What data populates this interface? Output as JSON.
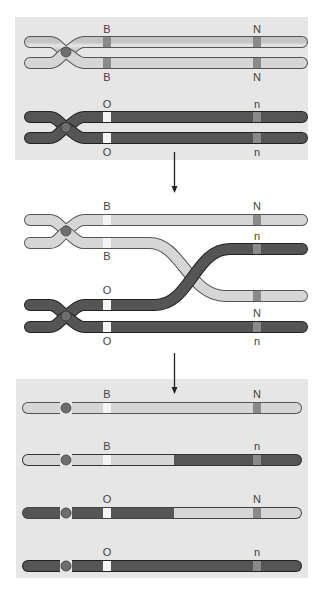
{
  "diagram": {
    "colors": {
      "panel_bg": "#e6e6e6",
      "light_chromatid": "#d2d2d2",
      "dark_chromatid": "#4a4a4a",
      "centromere": "#6e6e6e",
      "band_dark": "#8a8a8a",
      "band_white": "#f4f4f4",
      "arrow": "#222222"
    },
    "stages": [
      {
        "name": "paired-homologs",
        "labels": {
          "top_upper": "B",
          "top_upper_right": "N",
          "top_lower": "B",
          "top_lower_right": "N",
          "bottom_upper": "O",
          "bottom_upper_right": "n",
          "bottom_lower": "O",
          "bottom_lower_right": "n"
        }
      },
      {
        "name": "crossing-over",
        "labels": {
          "a_left": "B",
          "a_right": "N",
          "b_left": "B",
          "b_right_upper": "n",
          "c_left": "O",
          "c_right": "N",
          "d_left": "O",
          "d_right": "n"
        }
      },
      {
        "name": "recombinant-chromatids",
        "rows": [
          {
            "left": "B",
            "right": "N"
          },
          {
            "left": "B",
            "right": "n"
          },
          {
            "left": "O",
            "right": "N"
          },
          {
            "left": "O",
            "right": "n"
          }
        ]
      }
    ]
  }
}
